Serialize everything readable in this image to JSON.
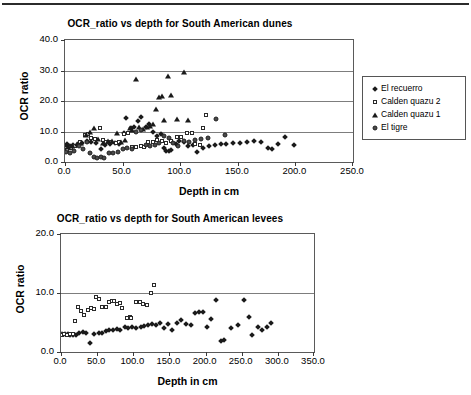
{
  "page": {
    "background_color": "#ffffff",
    "rule_color": "#2b2b2b"
  },
  "figures": [
    {
      "id": "dunes",
      "title": "OCR_ratio vs depth for South American dunes",
      "xlabel": "Depth in cm",
      "ylabel": "OCR ratio",
      "xticks": [
        "0.0",
        "50.0",
        "100.0",
        "150.0",
        "200.0",
        "250.0"
      ],
      "yticks": [
        "0.0",
        "10.0",
        "20.0",
        "30.0",
        "40.0"
      ],
      "legend": [
        {
          "label": "El recuerro",
          "marker": "diamond"
        },
        {
          "label": "Calden quazu 2",
          "marker": "square"
        },
        {
          "label": "Calden quazu 1",
          "marker": "triangle"
        },
        {
          "label": "El tigre",
          "marker": "circle"
        }
      ]
    },
    {
      "id": "levees",
      "title": "OCR_ratio vs depth for South American levees",
      "xlabel": "Depth in cm",
      "ylabel": "OCR ratio",
      "xticks": [
        "0.0",
        "50.0",
        "100.0",
        "150.0",
        "200.0",
        "250.0",
        "300.0",
        "350.0"
      ],
      "yticks": [
        "0.0",
        "10.0",
        "20.0"
      ],
      "legend": [
        {
          "label": "Paso Otero 5 OCR Ratio",
          "marker": "diamond"
        },
        {
          "label": "Compo Laborde OCR Ratio",
          "marker": "square"
        }
      ]
    }
  ],
  "chart_data": [
    {
      "type": "scatter",
      "title": "OCR_ratio vs depth for South American dunes",
      "xlabel": "Depth in cm",
      "ylabel": "OCR ratio",
      "xlim": [
        0.0,
        250.0
      ],
      "ylim": [
        0.0,
        40.0
      ],
      "xticks": [
        0.0,
        50.0,
        100.0,
        150.0,
        200.0,
        250.0
      ],
      "yticks": [
        0.0,
        10.0,
        20.0,
        30.0,
        40.0
      ],
      "grid": "horizontal",
      "legend_position": "right-outside",
      "series": [
        {
          "name": "El recuerro",
          "marker": "diamond",
          "color": "#1a1a1a",
          "points": [
            [
              2,
              5.8
            ],
            [
              4,
              5.2
            ],
            [
              7,
              5.5
            ],
            [
              11,
              5.9
            ],
            [
              15,
              6.1
            ],
            [
              19,
              7.0
            ],
            [
              23,
              6.6
            ],
            [
              27,
              6.2
            ],
            [
              31,
              4.3
            ],
            [
              35,
              5.6
            ],
            [
              39,
              6.0
            ],
            [
              43,
              6.3
            ],
            [
              47,
              5.8
            ],
            [
              51,
              9.5
            ],
            [
              53,
              14.3
            ],
            [
              57,
              11.0
            ],
            [
              60,
              11.4
            ],
            [
              63,
              13.6
            ],
            [
              66,
              14.9
            ],
            [
              70,
              11.5
            ],
            [
              73,
              12.3
            ],
            [
              76,
              9.9
            ],
            [
              80,
              8.5
            ],
            [
              83,
              9.1
            ],
            [
              86,
              4.7
            ],
            [
              88,
              3.6
            ],
            [
              90,
              3.5
            ],
            [
              92,
              4.0
            ],
            [
              96,
              6.0
            ],
            [
              99,
              6.8
            ],
            [
              103,
              6.6
            ],
            [
              107,
              5.4
            ],
            [
              111,
              5.6
            ],
            [
              115,
              3.4
            ],
            [
              120,
              4.6
            ],
            [
              125,
              5.4
            ],
            [
              130,
              5.7
            ],
            [
              135,
              5.8
            ],
            [
              140,
              6.0
            ],
            [
              146,
              6.2
            ],
            [
              152,
              6.3
            ],
            [
              158,
              6.5
            ],
            [
              164,
              6.8
            ],
            [
              170,
              6.5
            ],
            [
              176,
              4.7
            ],
            [
              180,
              4.3
            ],
            [
              185,
              5.8
            ],
            [
              191,
              8.1
            ],
            [
              199,
              5.7
            ]
          ]
        },
        {
          "name": "Calden quazu 2",
          "marker": "square",
          "color": "#2a2a2a",
          "points": [
            [
              2,
              4.0
            ],
            [
              5,
              4.6
            ],
            [
              9,
              5.4
            ],
            [
              13,
              6.4
            ],
            [
              17,
              8.8
            ],
            [
              20,
              9.2
            ],
            [
              23,
              7.9
            ],
            [
              26,
              7.6
            ],
            [
              30,
              11.3
            ],
            [
              33,
              7.2
            ],
            [
              36,
              6.4
            ],
            [
              40,
              6.7
            ],
            [
              44,
              6.2
            ],
            [
              47,
              6.6
            ],
            [
              51,
              9.3
            ],
            [
              55,
              9.4
            ],
            [
              58,
              5.0
            ],
            [
              62,
              4.9
            ],
            [
              66,
              5.3
            ],
            [
              69,
              4.8
            ],
            [
              72,
              6.7
            ],
            [
              76,
              6.5
            ],
            [
              80,
              7.2
            ],
            [
              84,
              7.0
            ],
            [
              88,
              6.1
            ],
            [
              92,
              6.8
            ],
            [
              97,
              8.1
            ],
            [
              101,
              8.3
            ],
            [
              106,
              9.5
            ],
            [
              110,
              9.4
            ],
            [
              113,
              6.0
            ],
            [
              117,
              5.7
            ],
            [
              120,
              11.2
            ],
            [
              122,
              15.3
            ]
          ]
        },
        {
          "name": "Calden quazu 1",
          "marker": "triangle",
          "color": "#1a1a1a",
          "points": [
            [
              1,
              5.6
            ],
            [
              3,
              5.0
            ],
            [
              6,
              5.3
            ],
            [
              10,
              5.9
            ],
            [
              14,
              6.2
            ],
            [
              18,
              8.9
            ],
            [
              22,
              9.8
            ],
            [
              25,
              11.1
            ],
            [
              29,
              7.4
            ],
            [
              33,
              6.3
            ],
            [
              37,
              6.9
            ],
            [
              41,
              7.0
            ],
            [
              45,
              9.6
            ],
            [
              49,
              6.5
            ],
            [
              52,
              7.1
            ],
            [
              56,
              11.3
            ],
            [
              58,
              10.6
            ],
            [
              62,
              27.3
            ],
            [
              64,
              11.4
            ],
            [
              68,
              10.7
            ],
            [
              71,
              11.4
            ],
            [
              74,
              11.9
            ],
            [
              76,
              12.5
            ],
            [
              79,
              17.3
            ],
            [
              82,
              21.4
            ],
            [
              84,
              21.8
            ],
            [
              86,
              13.9
            ],
            [
              89,
              28.2
            ],
            [
              92,
              22.1
            ],
            [
              103,
              29.6
            ],
            [
              97,
              14.1
            ],
            [
              107,
              13.9
            ]
          ]
        },
        {
          "name": "El tigre",
          "marker": "circle",
          "color": "#4a4a4a",
          "points": [
            [
              1,
              3.3
            ],
            [
              4,
              3.0
            ],
            [
              8,
              3.5
            ],
            [
              12,
              5.1
            ],
            [
              16,
              4.4
            ],
            [
              19,
              6.4
            ],
            [
              22,
              3.1
            ],
            [
              25,
              1.6
            ],
            [
              28,
              1.4
            ],
            [
              31,
              1.8
            ],
            [
              34,
              1.3
            ],
            [
              38,
              2.9
            ],
            [
              42,
              3.0
            ],
            [
              46,
              3.2
            ],
            [
              50,
              4.2
            ],
            [
              54,
              4.6
            ],
            [
              58,
              4.3
            ],
            [
              62,
              9.9
            ],
            [
              66,
              10.4
            ],
            [
              70,
              5.5
            ],
            [
              74,
              5.1
            ],
            [
              78,
              5.6
            ],
            [
              82,
              6.1
            ],
            [
              86,
              8.6
            ],
            [
              90,
              7.9
            ],
            [
              94,
              6.2
            ],
            [
              98,
              5.4
            ],
            [
              103,
              7.0
            ],
            [
              108,
              6.7
            ],
            [
              113,
              7.1
            ],
            [
              118,
              7.5
            ],
            [
              124,
              8.0
            ],
            [
              131,
              14.2
            ],
            [
              139,
              8.9
            ]
          ]
        }
      ]
    },
    {
      "type": "scatter",
      "title": "OCR_ratio vs depth for South American levees",
      "xlabel": "Depth in cm",
      "ylabel": "OCR ratio",
      "xlim": [
        0.0,
        350.0
      ],
      "ylim": [
        0.0,
        20.0
      ],
      "xticks": [
        0.0,
        50.0,
        100.0,
        150.0,
        200.0,
        250.0,
        300.0,
        350.0
      ],
      "yticks": [
        0.0,
        10.0,
        20.0
      ],
      "grid": "horizontal",
      "legend_position": "right-outside",
      "series": [
        {
          "name": "Paso Otero 5 OCR Ratio",
          "marker": "diamond",
          "color": "#1a1a1a",
          "points": [
            [
              2,
              3.0
            ],
            [
              5,
              3.1
            ],
            [
              9,
              3.0
            ],
            [
              13,
              2.9
            ],
            [
              17,
              2.9
            ],
            [
              21,
              2.9
            ],
            [
              25,
              3.2
            ],
            [
              30,
              3.4
            ],
            [
              35,
              3.3
            ],
            [
              40,
              1.6
            ],
            [
              46,
              3.0
            ],
            [
              52,
              3.2
            ],
            [
              57,
              3.3
            ],
            [
              62,
              3.5
            ],
            [
              67,
              3.7
            ],
            [
              72,
              3.8
            ],
            [
              77,
              3.9
            ],
            [
              82,
              3.7
            ],
            [
              88,
              4.2
            ],
            [
              93,
              4.1
            ],
            [
              98,
              4.2
            ],
            [
              104,
              4.1
            ],
            [
              110,
              4.3
            ],
            [
              115,
              4.4
            ],
            [
              120,
              4.6
            ],
            [
              126,
              4.7
            ],
            [
              131,
              4.6
            ],
            [
              137,
              4.9
            ],
            [
              142,
              4.1
            ],
            [
              148,
              4.8
            ],
            [
              153,
              3.8
            ],
            [
              160,
              5.0
            ],
            [
              166,
              5.4
            ],
            [
              173,
              4.7
            ],
            [
              180,
              4.5
            ],
            [
              186,
              6.6
            ],
            [
              191,
              6.8
            ],
            [
              196,
              6.7
            ],
            [
              202,
              4.2
            ],
            [
              208,
              5.6
            ],
            [
              215,
              8.8
            ],
            [
              221,
              1.9
            ],
            [
              226,
              2.1
            ],
            [
              235,
              4.1
            ],
            [
              245,
              4.6
            ],
            [
              253,
              8.8
            ],
            [
              260,
              5.9
            ],
            [
              264,
              2.8
            ],
            [
              272,
              4.3
            ],
            [
              278,
              3.7
            ],
            [
              285,
              4.2
            ],
            [
              290,
              5.0
            ]
          ]
        },
        {
          "name": "Compo Laborde OCR Ratio",
          "marker": "square",
          "color": "#2a2a2a",
          "points": [
            [
              1,
              2.9
            ],
            [
              4,
              3.0
            ],
            [
              8,
              2.9
            ],
            [
              12,
              3.1
            ],
            [
              16,
              3.0
            ],
            [
              19,
              5.2
            ],
            [
              24,
              7.7
            ],
            [
              28,
              6.9
            ],
            [
              32,
              6.3
            ],
            [
              37,
              7.2
            ],
            [
              42,
              7.4
            ],
            [
              46,
              7.3
            ],
            [
              49,
              9.4
            ],
            [
              52,
              9.0
            ],
            [
              57,
              7.6
            ],
            [
              62,
              7.6
            ],
            [
              66,
              8.5
            ],
            [
              70,
              8.6
            ],
            [
              73,
              8.6
            ],
            [
              77,
              8.2
            ],
            [
              81,
              8.3
            ],
            [
              85,
              7.5
            ],
            [
              91,
              5.8
            ],
            [
              95,
              5.9
            ],
            [
              97,
              5.7
            ],
            [
              104,
              8.5
            ],
            [
              109,
              8.4
            ],
            [
              114,
              8.1
            ],
            [
              119,
              7.9
            ],
            [
              125,
              10.0
            ],
            [
              129,
              11.3
            ]
          ]
        }
      ]
    }
  ]
}
